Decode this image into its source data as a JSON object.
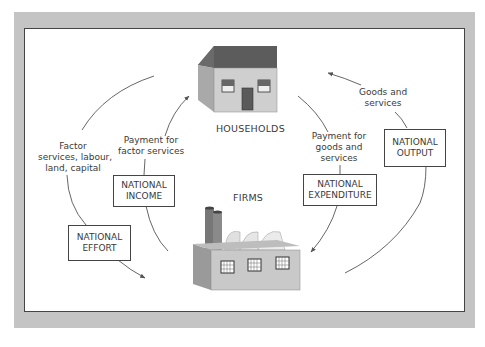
{
  "diagram": {
    "nodes": {
      "households": {
        "label": "HOUSEHOLDS"
      },
      "firms": {
        "label": "FIRMS"
      }
    },
    "flow_labels": {
      "factor_services": [
        "Factor",
        "services, labour,",
        "land, capital"
      ],
      "payment_factor": [
        "Payment for",
        "factor services"
      ],
      "payment_goods": [
        "Payment for",
        "goods and",
        "services"
      ],
      "goods_services": [
        "Goods and",
        "services"
      ]
    },
    "boxes": {
      "national_income": [
        "NATIONAL",
        "INCOME"
      ],
      "national_effort": [
        "NATIONAL",
        "EFFORT"
      ],
      "national_expenditure": [
        "NATIONAL",
        "EXPENDITURE"
      ],
      "national_output": [
        "NATIONAL",
        "OUTPUT"
      ]
    },
    "edges": [
      {
        "from": "firms",
        "to": "households",
        "label": "Payment for factor services",
        "box": "NATIONAL INCOME"
      },
      {
        "from": "households",
        "to": "firms",
        "label": "Factor services, labour, land, capital",
        "box": "NATIONAL EFFORT"
      },
      {
        "from": "households",
        "to": "firms",
        "label": "Payment for goods and services",
        "box": "NATIONAL EXPENDITURE"
      },
      {
        "from": "firms",
        "to": "households",
        "label": "Goods and services",
        "box": "NATIONAL OUTPUT"
      }
    ],
    "colors": {
      "frame": "#c4c4c4",
      "panel_border": "#444444",
      "roof": "#5a5a5a",
      "wall": "#cfcfcf",
      "arrow": "#555555"
    }
  }
}
